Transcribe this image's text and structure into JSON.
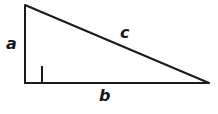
{
  "figure": {
    "name": "right-triangle",
    "background_color": "#ffffff",
    "stroke_color": "#1a1a1a",
    "stroke_width": 2,
    "canvas": {
      "width": 218,
      "height": 114
    }
  },
  "geometry": {
    "vertices": {
      "apex": {
        "x": 25,
        "y": 5
      },
      "right_angle": {
        "x": 25,
        "y": 83
      },
      "far": {
        "x": 209,
        "y": 83
      }
    },
    "right_angle_marker": {
      "x": 25,
      "y": 66,
      "size": 17,
      "shown": true
    },
    "sides": [
      {
        "id": "a",
        "role": "vertical-leg",
        "from": "apex",
        "to": "right_angle"
      },
      {
        "id": "b",
        "role": "horizontal-leg",
        "from": "right_angle",
        "to": "far"
      },
      {
        "id": "c",
        "role": "hypotenuse",
        "from": "apex",
        "to": "far"
      }
    ]
  },
  "labels": {
    "a": "a",
    "b": "b",
    "c": "c"
  }
}
